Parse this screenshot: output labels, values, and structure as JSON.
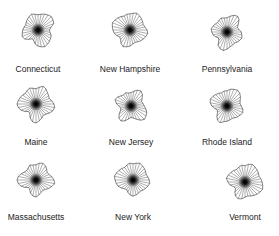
{
  "chart_data": {
    "type": "star",
    "title": "",
    "layout": {
      "rows": 3,
      "cols": 3
    },
    "n_rays": 32,
    "items": [
      {
        "name": "Connecticut",
        "cx": 38,
        "cy": 30,
        "label_y": 72,
        "values": [
          0.8,
          0.85,
          0.9,
          0.95,
          1.0,
          0.95,
          0.9,
          0.7,
          0.6,
          0.65,
          0.75,
          0.8,
          0.85,
          0.9,
          0.95,
          0.9,
          0.85,
          0.75,
          0.6,
          0.55,
          0.7,
          0.85,
          0.9,
          0.85,
          0.8,
          0.75,
          0.7,
          0.75,
          0.8,
          0.85,
          0.9,
          0.85
        ]
      },
      {
        "name": "New Hampshire",
        "cx": 130,
        "cy": 30,
        "label_y": 72,
        "values": [
          0.85,
          0.9,
          0.95,
          0.9,
          0.85,
          0.8,
          0.75,
          0.8,
          0.9,
          0.95,
          0.9,
          0.85,
          0.8,
          0.75,
          0.7,
          0.75,
          0.85,
          0.9,
          0.95,
          0.85,
          0.7,
          0.65,
          0.75,
          0.85,
          0.9,
          0.95,
          1.0,
          0.95,
          0.9,
          0.85,
          0.8,
          0.85
        ]
      },
      {
        "name": "Pennsylvania",
        "cx": 227,
        "cy": 32,
        "label_y": 72,
        "values": [
          0.75,
          0.85,
          0.95,
          1.0,
          0.9,
          0.7,
          0.6,
          0.65,
          0.75,
          0.8,
          0.85,
          0.8,
          0.75,
          0.7,
          0.75,
          0.8,
          0.9,
          1.0,
          0.95,
          0.85,
          0.6,
          0.55,
          0.65,
          0.75,
          0.8,
          0.85,
          0.8,
          0.75,
          0.7,
          0.75,
          0.8,
          0.75
        ]
      },
      {
        "name": "Maine",
        "cx": 36,
        "cy": 104,
        "label_y": 145,
        "values": [
          0.8,
          0.9,
          1.0,
          0.95,
          0.85,
          0.8,
          0.75,
          0.85,
          0.95,
          1.0,
          0.95,
          0.85,
          0.75,
          0.7,
          0.8,
          0.9,
          1.0,
          0.95,
          0.8,
          0.6,
          0.55,
          0.7,
          0.85,
          0.95,
          1.0,
          0.95,
          0.9,
          0.85,
          0.8,
          0.85,
          0.9,
          0.85
        ]
      },
      {
        "name": "New Jersey",
        "cx": 131,
        "cy": 106,
        "label_y": 145,
        "values": [
          0.7,
          0.8,
          0.9,
          0.95,
          0.85,
          0.7,
          0.6,
          0.65,
          0.7,
          0.8,
          0.9,
          0.95,
          1.0,
          0.9,
          0.75,
          0.65,
          0.6,
          0.7,
          0.85,
          0.95,
          0.9,
          0.75,
          0.6,
          0.55,
          0.65,
          0.8,
          0.9,
          0.85,
          0.75,
          0.7,
          0.75,
          0.7
        ]
      },
      {
        "name": "Rhode Island",
        "cx": 227,
        "cy": 106,
        "label_y": 145,
        "values": [
          0.8,
          0.9,
          0.95,
          1.0,
          0.95,
          0.85,
          0.75,
          0.7,
          0.75,
          0.85,
          0.9,
          0.85,
          0.8,
          0.75,
          0.7,
          0.75,
          0.8,
          0.85,
          0.95,
          0.9,
          0.75,
          0.6,
          0.55,
          0.65,
          0.8,
          0.9,
          0.95,
          0.9,
          0.85,
          0.8,
          0.75,
          0.8
        ]
      },
      {
        "name": "Massachusetts",
        "cx": 36,
        "cy": 180,
        "label_y": 220,
        "values": [
          0.8,
          0.9,
          0.95,
          0.9,
          0.8,
          0.7,
          0.75,
          0.85,
          0.95,
          1.0,
          0.9,
          0.8,
          0.7,
          0.65,
          0.7,
          0.8,
          0.9,
          0.85,
          0.75,
          0.6,
          0.55,
          0.7,
          0.85,
          0.95,
          1.0,
          0.95,
          0.85,
          0.75,
          0.7,
          0.75,
          0.85,
          0.8
        ]
      },
      {
        "name": "New York",
        "cx": 133,
        "cy": 180,
        "label_y": 220,
        "values": [
          0.85,
          0.9,
          0.95,
          0.9,
          0.85,
          0.8,
          0.75,
          0.8,
          0.85,
          0.9,
          0.85,
          0.8,
          0.75,
          0.7,
          0.75,
          0.8,
          0.85,
          0.8,
          0.7,
          0.6,
          0.65,
          0.75,
          0.85,
          0.9,
          0.95,
          1.0,
          0.95,
          0.9,
          0.85,
          0.8,
          0.85,
          0.9
        ]
      },
      {
        "name": "Vermont",
        "cx": 245,
        "cy": 182,
        "label_y": 220,
        "values": [
          0.85,
          0.95,
          1.0,
          0.95,
          0.9,
          0.85,
          0.8,
          0.85,
          0.9,
          0.95,
          1.0,
          0.95,
          0.9,
          0.85,
          0.8,
          0.75,
          0.8,
          0.9,
          0.95,
          0.9,
          0.75,
          0.6,
          0.65,
          0.8,
          0.9,
          1.0,
          0.95,
          0.9,
          0.85,
          0.8,
          0.85,
          0.9
        ]
      }
    ],
    "radius": 19,
    "xlabel": "",
    "ylabel": ""
  },
  "colors": {
    "line": "#333333",
    "center": "#000000",
    "text": "#222222"
  }
}
